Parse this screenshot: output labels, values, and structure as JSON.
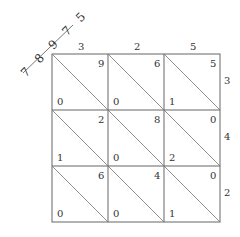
{
  "diagram": {
    "type": "lattice-multiplication",
    "multiplicand_digits": [
      "3",
      "2",
      "5"
    ],
    "multiplier_digits": [
      "3",
      "4",
      "2"
    ],
    "result_digits": "7 8 9 7 5",
    "cells": [
      [
        {
          "tens": "0",
          "units": "9"
        },
        {
          "tens": "0",
          "units": "6"
        },
        {
          "tens": "1",
          "units": "5"
        }
      ],
      [
        {
          "tens": "1",
          "units": "2"
        },
        {
          "tens": "0",
          "units": "8"
        },
        {
          "tens": "2",
          "units": "0"
        }
      ],
      [
        {
          "tens": "0",
          "units": "6"
        },
        {
          "tens": "0",
          "units": "4"
        },
        {
          "tens": "1",
          "units": "0"
        }
      ]
    ],
    "colors": {
      "line": "#555555",
      "text": "#333333",
      "background": "#ffffff"
    }
  }
}
